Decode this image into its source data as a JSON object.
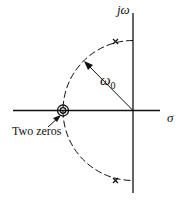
{
  "diagram": {
    "type": "s-plane pole-zero plot",
    "axes": {
      "vertical_label": "jω",
      "horizontal_label": "σ"
    },
    "radius_label": "ω",
    "radius_subscript": "0",
    "annotation": "Two zeros",
    "poles": [
      {
        "name": "upper-pole",
        "symbol": "×"
      },
      {
        "name": "lower-pole",
        "symbol": "×"
      }
    ],
    "zeros": {
      "count": 2,
      "symbol": "double circle"
    },
    "colors": {
      "ink": "#111111",
      "background": "#ffffff"
    }
  }
}
